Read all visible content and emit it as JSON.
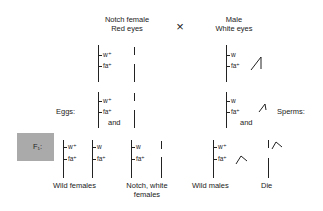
{
  "parents": {
    "female": {
      "line1": "Notch female",
      "line2": "Red eyes"
    },
    "cross_symbol": "×",
    "male": {
      "line1": "Male",
      "line2": "White eyes"
    }
  },
  "parent_genes": {
    "female": [
      "w⁺",
      "fa⁺"
    ],
    "male": [
      "w",
      "fa⁺"
    ]
  },
  "gametes": {
    "eggs_label": "Eggs:",
    "eggs_genes": [
      "w⁺",
      "fa⁺"
    ],
    "eggs_and": "and",
    "sperms_label": "Sperms:",
    "sperms_genes": [
      "w",
      "fa⁺"
    ],
    "sperms_and": "and"
  },
  "f1": {
    "label": "F₁:",
    "box_color": "#aaaaaa",
    "groups": [
      {
        "genes_a": [
          "w⁺",
          "fa⁺"
        ],
        "genes_b": [
          "w",
          "fa⁺"
        ],
        "label": "Wild females"
      },
      {
        "genes_a": [
          "w",
          "fa⁺"
        ],
        "label_line1": "Notch, white",
        "label_line2": "females"
      },
      {
        "genes_a": [
          "w⁺",
          "fa⁺"
        ],
        "label": "Wild males"
      },
      {
        "label": "Die"
      }
    ]
  }
}
